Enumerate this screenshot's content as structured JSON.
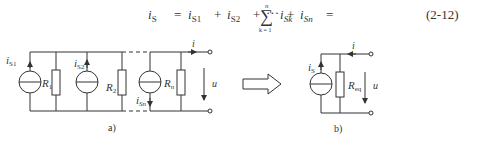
{
  "equation": {
    "lhs": "i",
    "lhs_sub": "S",
    "eq1": "=",
    "terms": [
      {
        "sym": "i",
        "sub": "S1"
      },
      {
        "sym": "i",
        "sub": "S2"
      },
      {
        "sym": "i",
        "sub": "Sn"
      }
    ],
    "plus": "+",
    "dots": "···",
    "eq2": "=",
    "sum_symbol": "∑",
    "sum_upper": "n",
    "sum_lower": "k = 1",
    "sum_term": "i",
    "sum_term_sub": "Sk",
    "number": "(2-12)"
  },
  "figure_a": {
    "caption": "a)",
    "sources": [
      {
        "label": "i",
        "sub": "S1"
      },
      {
        "label": "i",
        "sub": "S2"
      },
      {
        "label": "i",
        "sub": "Sn"
      }
    ],
    "resistors": [
      {
        "label": "R",
        "sub": "1"
      },
      {
        "label": "R",
        "sub": "2"
      },
      {
        "label": "R",
        "sub": "n"
      }
    ],
    "current_label": "i",
    "voltage_label": "u"
  },
  "transform_arrow": "equivalent-arrow",
  "figure_b": {
    "caption": "b)",
    "source": {
      "label": "i",
      "sub": "S"
    },
    "resistor": {
      "label": "R",
      "sub": "eq"
    },
    "current_label": "i",
    "voltage_label": "u"
  }
}
